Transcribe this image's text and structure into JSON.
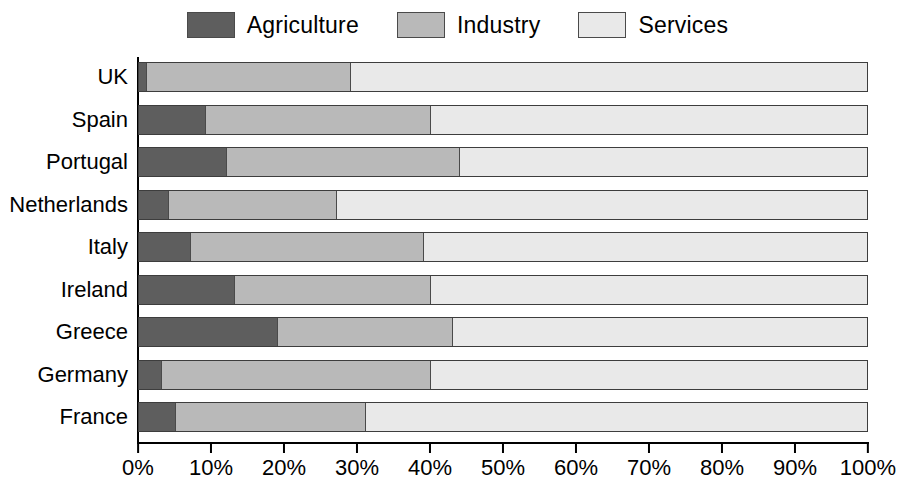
{
  "chart_data": {
    "type": "bar",
    "subtype": "stacked-horizontal-100-percent",
    "title": "",
    "xlabel": "",
    "ylabel": "",
    "xlim": [
      0,
      100
    ],
    "grid": false,
    "legend_position": "top-center",
    "categories": [
      "UK",
      "Spain",
      "Portugal",
      "Netherlands",
      "Italy",
      "Ireland",
      "Greece",
      "Germany",
      "France"
    ],
    "series": [
      {
        "name": "Agriculture",
        "color": "#5e5e5e",
        "values": [
          1,
          9,
          12,
          4,
          7,
          13,
          19,
          3,
          5
        ]
      },
      {
        "name": "Industry",
        "color": "#b9b9b9",
        "values": [
          28,
          31,
          32,
          23,
          32,
          27,
          24,
          37,
          26
        ]
      },
      {
        "name": "Services",
        "color": "#e9e9e9",
        "values": [
          71,
          60,
          56,
          73,
          61,
          60,
          57,
          60,
          69
        ]
      }
    ],
    "x_tick_labels": [
      "0%",
      "10%",
      "20%",
      "30%",
      "40%",
      "50%",
      "60%",
      "70%",
      "80%",
      "90%",
      "100%"
    ],
    "x_tick_values": [
      0,
      10,
      20,
      30,
      40,
      50,
      60,
      70,
      80,
      90,
      100
    ]
  },
  "legend": {
    "items": [
      {
        "label": "Agriculture",
        "color": "#5e5e5e",
        "swatch_name": "legend-swatch-agriculture"
      },
      {
        "label": "Industry",
        "color": "#b9b9b9",
        "swatch_name": "legend-swatch-industry"
      },
      {
        "label": "Services",
        "color": "#e9e9e9",
        "swatch_name": "legend-swatch-services"
      }
    ]
  },
  "colors": {
    "agriculture": "#5e5e5e",
    "industry": "#b9b9b9",
    "services": "#e9e9e9",
    "axis": "#000000",
    "background": "#ffffff",
    "bar_border": "#3d3d3d"
  }
}
